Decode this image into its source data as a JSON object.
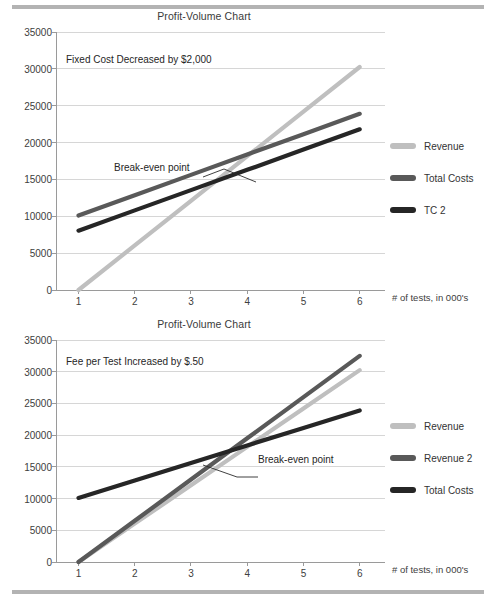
{
  "page": {
    "rules": [
      "top-divider",
      "bottom-divider"
    ]
  },
  "charts": [
    {
      "id": "top",
      "title": "Profit-Volume Chart",
      "annotation_note": "Fixed Cost Decreased by $2,000",
      "callout": "Break-even point",
      "xaxis_title": "# of tests, in 000's",
      "legend": [
        {
          "label": "Revenue",
          "color": "#bfbfbf"
        },
        {
          "label": "Total Costs",
          "color": "#595959"
        },
        {
          "label": "TC 2",
          "color": "#262626"
        }
      ],
      "chart_data": {
        "type": "line",
        "title": "Profit-Volume Chart",
        "xlabel": "# of tests, in 000's",
        "ylabel": "",
        "x": [
          1,
          2,
          3,
          4,
          5,
          6
        ],
        "xticklabels": [
          "1",
          "2",
          "3",
          "4",
          "5",
          "6"
        ],
        "yticklabels": [
          "0",
          "5000",
          "10000",
          "15000",
          "20000",
          "25000",
          "30000",
          "35000"
        ],
        "yticks": [
          0,
          5000,
          10000,
          15000,
          20000,
          25000,
          30000,
          35000
        ],
        "xlim": [
          0.6,
          6.45
        ],
        "ylim": [
          0,
          35000
        ],
        "grid": true,
        "legend_position": "right",
        "annotations": [
          "Fixed Cost Decreased by $2,000",
          "Break-even point"
        ],
        "series": [
          {
            "name": "Revenue",
            "color": "#bfbfbf",
            "values": [
              0,
              6050,
              12100,
              18150,
              24200,
              30250
            ]
          },
          {
            "name": "Total Costs",
            "color": "#595959",
            "values": [
              10100,
              12860,
              15620,
              18380,
              21140,
              23900
            ]
          },
          {
            "name": "TC 2",
            "color": "#262626",
            "values": [
              8050,
              10800,
              13550,
              16300,
              19050,
              21800
            ]
          }
        ]
      }
    },
    {
      "id": "bottom",
      "title": "Profit-Volume Chart",
      "annotation_note": "Fee per Test Increased by $.50",
      "callout": "Break-even point",
      "xaxis_title": "# of tests, in 000's",
      "legend": [
        {
          "label": "Revenue",
          "color": "#bfbfbf"
        },
        {
          "label": "Revenue 2",
          "color": "#595959"
        },
        {
          "label": "Total Costs",
          "color": "#262626"
        }
      ],
      "chart_data": {
        "type": "line",
        "title": "Profit-Volume Chart",
        "xlabel": "# of tests, in 000's",
        "ylabel": "",
        "x": [
          1,
          2,
          3,
          4,
          5,
          6
        ],
        "xticklabels": [
          "1",
          "2",
          "3",
          "4",
          "5",
          "6"
        ],
        "yticklabels": [
          "0",
          "5000",
          "10000",
          "15000",
          "20000",
          "25000",
          "30000",
          "35000"
        ],
        "yticks": [
          0,
          5000,
          10000,
          15000,
          20000,
          25000,
          30000,
          35000
        ],
        "xlim": [
          0.6,
          6.45
        ],
        "ylim": [
          0,
          35000
        ],
        "grid": true,
        "legend_position": "right",
        "annotations": [
          "Fee per Test Increased by $.50",
          "Break-even point"
        ],
        "series": [
          {
            "name": "Revenue",
            "color": "#bfbfbf",
            "values": [
              0,
              6050,
              12100,
              18150,
              24200,
              30250
            ]
          },
          {
            "name": "Revenue 2",
            "color": "#595959",
            "values": [
              0,
              6500,
              13000,
              19500,
              26000,
              32500
            ]
          },
          {
            "name": "Total Costs",
            "color": "#262626",
            "values": [
              10100,
              12860,
              15620,
              18380,
              21140,
              23900
            ]
          }
        ]
      }
    }
  ]
}
